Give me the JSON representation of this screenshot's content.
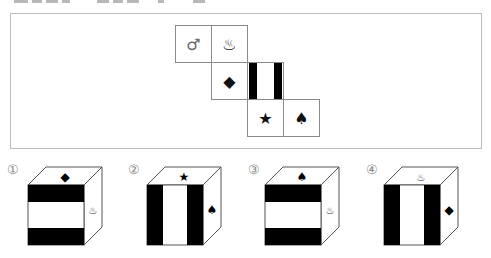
{
  "question_fragment": "clipped header line (illegible)",
  "net": {
    "cells": [
      {
        "id": "r1c1",
        "symbol": "♂",
        "name": "male-symbol"
      },
      {
        "id": "r1c2",
        "symbol": "♨",
        "name": "hot-spring-symbol"
      },
      {
        "id": "r2c1",
        "symbol": "◆",
        "name": "diamond-symbol"
      },
      {
        "id": "r2c2",
        "symbol": "",
        "name": "vertical-stripes-face"
      },
      {
        "id": "r3c1",
        "symbol": "★",
        "name": "star-symbol"
      },
      {
        "id": "r3c2",
        "symbol": "♠",
        "name": "spade-symbol"
      }
    ]
  },
  "options": [
    {
      "label": "①",
      "top": "◆",
      "side": "♨",
      "front": "horizontal-stripes"
    },
    {
      "label": "②",
      "top": "★",
      "side": "♠",
      "front": "vertical-stripes"
    },
    {
      "label": "③",
      "top": "♠",
      "side": "♨",
      "front": "horizontal-stripes"
    },
    {
      "label": "④",
      "top": "♨",
      "side": "◆",
      "front": "vertical-stripes"
    }
  ]
}
